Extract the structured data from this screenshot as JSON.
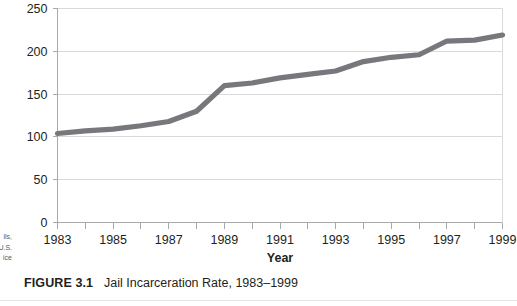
{
  "figure": {
    "caption_label": "FIGURE 3.1",
    "caption_title": "Jail Incarceration Rate, 1983–1999",
    "source_note_lines": [
      "ils,",
      "U.S.",
      "ice"
    ]
  },
  "chart_data": {
    "type": "line",
    "title": "Jail Incarceration Rate, 1983–1999",
    "xlabel": "Year",
    "ylabel": "",
    "x": [
      1983,
      1984,
      1985,
      1986,
      1987,
      1988,
      1989,
      1990,
      1991,
      1992,
      1993,
      1994,
      1995,
      1996,
      1997,
      1998,
      1999
    ],
    "values": [
      104,
      107,
      109,
      113,
      118,
      130,
      160,
      163,
      169,
      173,
      177,
      188,
      193,
      196,
      212,
      213,
      219
    ],
    "series": [
      {
        "name": "Jail incarceration rate",
        "values": [
          104,
          107,
          109,
          113,
          118,
          130,
          160,
          163,
          169,
          173,
          177,
          188,
          193,
          196,
          212,
          213,
          219
        ],
        "color": "#77787b"
      }
    ],
    "xlim": [
      1983,
      1999
    ],
    "ylim": [
      0,
      250
    ],
    "x_tick_labels": [
      "1983",
      "1985",
      "1987",
      "1989",
      "1991",
      "1993",
      "1995",
      "1997",
      "1999"
    ],
    "x_tick_values": [
      1983,
      1985,
      1987,
      1989,
      1991,
      1993,
      1995,
      1997,
      1999
    ],
    "x_minor_tick_values": [
      1984,
      1986,
      1988,
      1990,
      1992,
      1994,
      1996,
      1998
    ],
    "y_tick_labels": [
      "0",
      "50",
      "100",
      "150",
      "200",
      "250"
    ],
    "y_tick_values": [
      0,
      50,
      100,
      150,
      200,
      250
    ],
    "grid": "horizontal",
    "legend": "none"
  }
}
